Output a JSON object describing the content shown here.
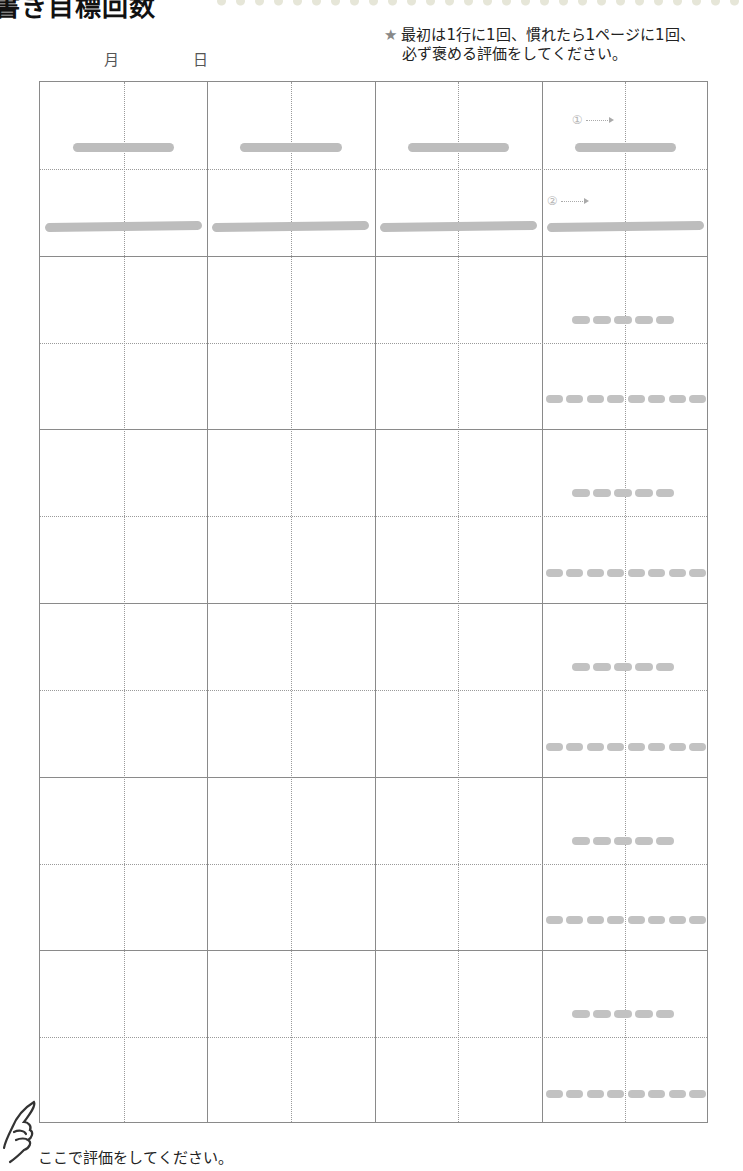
{
  "header": {
    "title_clipped": "書き目標回数",
    "date_month_label": "月",
    "date_day_label": "日"
  },
  "instructions": {
    "star_icon": "★",
    "line1": "最初は1行に1回、慣れたら1ページに1回、",
    "line2": "必ず褒める評価をしてください。"
  },
  "grid": {
    "columns": 4,
    "main_rows": 6,
    "sub_rows_per_row": 2,
    "row1_markers": [
      "①",
      "②"
    ],
    "dash_counts": {
      "upper": 5,
      "lower": 8
    }
  },
  "footer": {
    "hand_icon": "pointing-hand",
    "text": "ここで評価をしてください。"
  },
  "colors": {
    "grid_line": "#8a8a8a",
    "guide_stroke": "#bdbdbd",
    "text": "#222222"
  }
}
